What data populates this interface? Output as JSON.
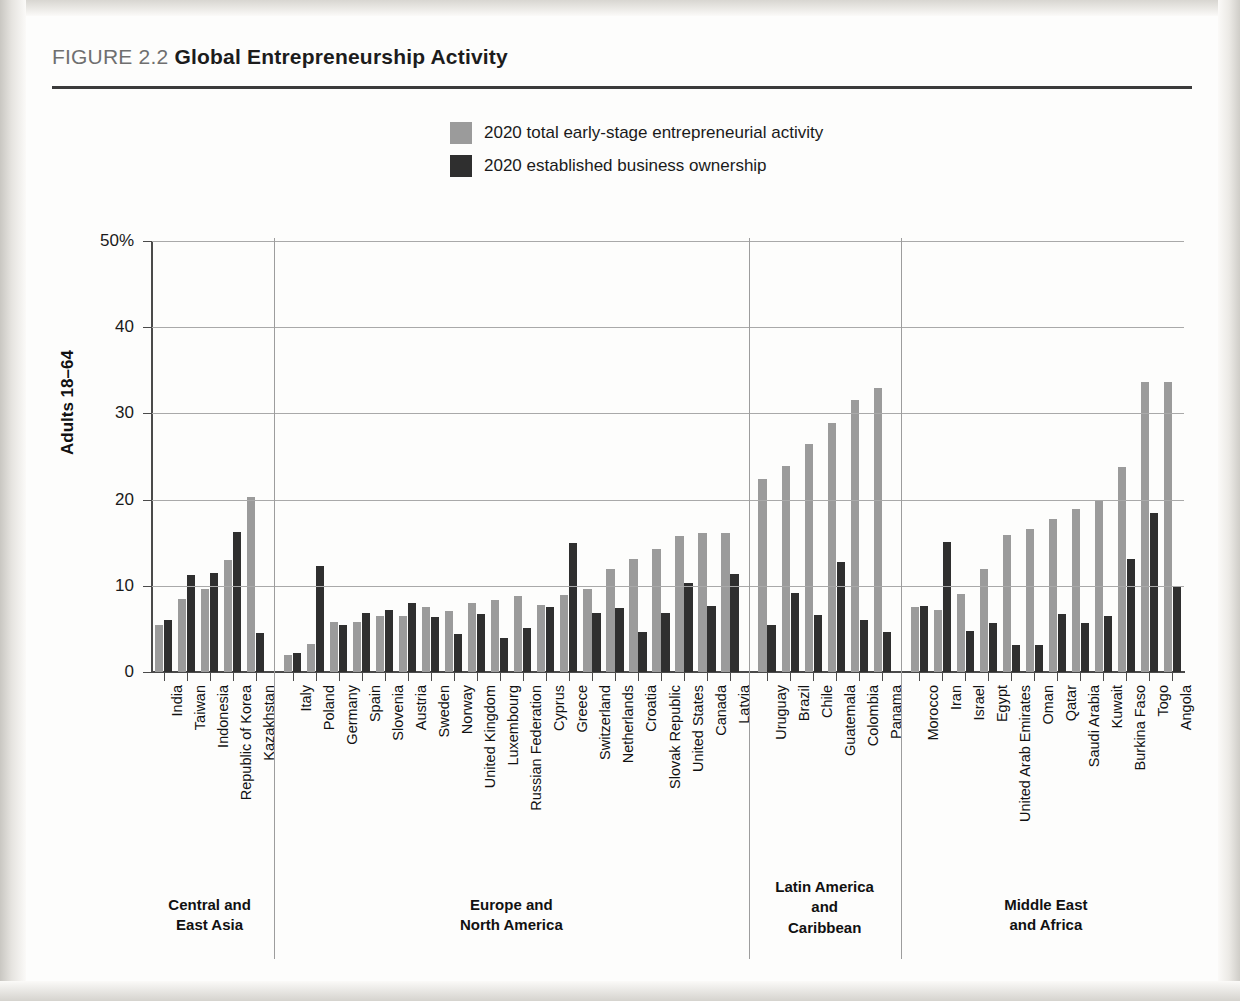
{
  "figure": {
    "number_label": "FIGURE 2.2",
    "title": "Global Entrepreneurship Activity"
  },
  "legend": {
    "items": [
      {
        "label": "2020 total early-stage entrepreneurial activity",
        "color": "#9b9b9b",
        "key": "tea"
      },
      {
        "label": "2020 established business ownership",
        "color": "#2f2f2f",
        "key": "ebo"
      }
    ]
  },
  "axes": {
    "y_title": "Adults 18–64",
    "y_ticks": [
      "0",
      "10",
      "20",
      "30",
      "40",
      "50%"
    ]
  },
  "regions": [
    {
      "name": "Central and\nEast Asia",
      "line1": "Central and",
      "line2": "East Asia",
      "line3": ""
    },
    {
      "name": "Europe and\nNorth America",
      "line1": "Europe and",
      "line2": "North America",
      "line3": ""
    },
    {
      "name": "Latin America and Caribbean",
      "line1": "Latin America",
      "line2": "and",
      "line3": "Caribbean"
    },
    {
      "name": "Middle East and Africa",
      "line1": "Middle East",
      "line2": "and Africa",
      "line3": ""
    }
  ],
  "chart_data": {
    "type": "bar",
    "title": "Global Entrepreneurship Activity",
    "xlabel": "",
    "ylabel": "Adults 18–64",
    "ylim": [
      0,
      50
    ],
    "yticks": [
      0,
      10,
      20,
      30,
      40,
      50
    ],
    "grid": true,
    "legend_position": "top-center",
    "series": [
      {
        "name": "2020 total early-stage entrepreneurial activity",
        "color": "#9b9b9b",
        "values": [
          5.5,
          8.5,
          9.6,
          13.0,
          20.3,
          2.0,
          3.3,
          5.8,
          5.8,
          6.5,
          6.5,
          7.5,
          7.1,
          8.0,
          8.3,
          8.8,
          7.8,
          8.9,
          9.6,
          11.9,
          13.1,
          14.3,
          15.8,
          16.1,
          16.1,
          22.4,
          23.9,
          26.4,
          28.9,
          31.5,
          32.9,
          7.5,
          7.2,
          9.0,
          11.9,
          15.9,
          16.6,
          17.8,
          18.9,
          20.0,
          23.8,
          33.6,
          33.6
        ]
      },
      {
        "name": "2020 established business ownership",
        "color": "#2f2f2f",
        "values": [
          6.0,
          11.2,
          11.5,
          16.2,
          4.5,
          2.2,
          12.3,
          5.5,
          6.8,
          7.2,
          8.0,
          6.4,
          4.4,
          6.7,
          4.0,
          5.1,
          7.6,
          15.0,
          6.9,
          7.4,
          4.7,
          6.8,
          10.3,
          7.7,
          11.4,
          5.5,
          9.2,
          6.6,
          12.8,
          6.0,
          4.7,
          7.7,
          15.1,
          4.8,
          5.7,
          3.1,
          3.1,
          6.7,
          5.7,
          6.5,
          13.1,
          18.4,
          9.9
        ]
      }
    ],
    "groups": [
      {
        "region": "Central and East Asia",
        "categories": [
          "India",
          "Taiwan",
          "Indonesia",
          "Republic of Korea",
          "Kazakhstan"
        ]
      },
      {
        "region": "Europe and North America",
        "categories": [
          "Italy",
          "Poland",
          "Germany",
          "Spain",
          "Slovenia",
          "Austria",
          "Sweden",
          "Norway",
          "United Kingdom",
          "Luxembourg",
          "Russian Federation",
          "Cyprus",
          "Greece",
          "Switzerland",
          "Netherlands",
          "Croatia",
          "Slovak Republic",
          "United States",
          "Canada",
          "Latvia"
        ]
      },
      {
        "region": "Latin America and Caribbean",
        "categories": [
          "Uruguay",
          "Brazil",
          "Chile",
          "Guatemala",
          "Colombia",
          "Panama"
        ]
      },
      {
        "region": "Middle East and Africa",
        "categories": [
          "Morocco",
          "Iran",
          "Israel",
          "Egypt",
          "United Arab Emirates",
          "Oman",
          "Qatar",
          "Saudi Arabia",
          "Kuwait",
          "Burkina Faso",
          "Togo",
          "Angola"
        ]
      }
    ],
    "categories": [
      "India",
      "Taiwan",
      "Indonesia",
      "Republic of Korea",
      "Kazakhstan",
      "Italy",
      "Poland",
      "Germany",
      "Spain",
      "Slovenia",
      "Austria",
      "Sweden",
      "Norway",
      "United Kingdom",
      "Luxembourg",
      "Russian Federation",
      "Cyprus",
      "Greece",
      "Switzerland",
      "Netherlands",
      "Croatia",
      "Slovak Republic",
      "United States",
      "Canada",
      "Latvia",
      "Uruguay",
      "Brazil",
      "Chile",
      "Guatemala",
      "Colombia",
      "Panama",
      "Morocco",
      "Iran",
      "Israel",
      "Egypt",
      "United Arab Emirates",
      "Oman",
      "Qatar",
      "Saudi Arabia",
      "Kuwait",
      "Burkina Faso",
      "Togo",
      "Angola"
    ]
  }
}
